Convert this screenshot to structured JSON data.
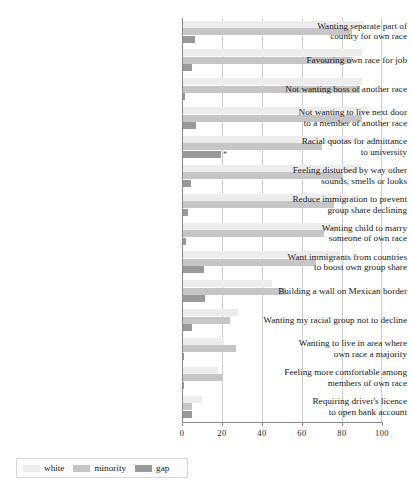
{
  "chart_data": {
    "type": "bar",
    "orientation": "horizontal",
    "title": "",
    "subtitle": "",
    "xlabel": "",
    "ylabel": "",
    "xlim": [
      0,
      100
    ],
    "xticks": [
      0,
      20,
      40,
      60,
      80,
      100
    ],
    "xtick_labels": [
      "0",
      "20",
      "40",
      "60",
      "80",
      "100"
    ],
    "grid": true,
    "grid_axis": "x",
    "legend_position": "bottom-left",
    "legend": [
      {
        "name": "white",
        "color": "#ececec"
      },
      {
        "name": "minority",
        "color": "#c6c6c6"
      },
      {
        "name": "gap",
        "color": "#9a9a9a"
      }
    ],
    "categories": [
      "Wanting separate part of\ncountry for own race",
      "Favouring own race for job",
      "Not wanting boss of another race",
      "Not wanting to live next door\nto a member of another race",
      "Racial quotas for admittance\nto university",
      "Feeling disturbed by way other\nsounds, smells or looks",
      "Reduce immigration to prevent\ngroup share declining",
      "Wanting child to marry\nsomeone of own race",
      "Want immigrants from countries\nto boost own group share",
      "Building a wall on Mexican border",
      "Wanting my racial group not to decline",
      "Wanting to live in area where\nown race a majority",
      "Feeling more comfortable among\nmembers of own race",
      "Requiring driver's licence\nto open bank account"
    ],
    "series": [
      {
        "name": "white",
        "color": "#ececec",
        "values": [
          91,
          90,
          90,
          93,
          86,
          89,
          83,
          78,
          79,
          45,
          28,
          21,
          18,
          10
        ]
      },
      {
        "name": "minority",
        "color": "#c6c6c6",
        "values": [
          85,
          85,
          89,
          90,
          70,
          80,
          76,
          71,
          67,
          52,
          24,
          27,
          20,
          5
        ]
      },
      {
        "name": "gap",
        "color": "#9a9a9a",
        "values": [
          6.5,
          5,
          1.5,
          7,
          19.5,
          4.5,
          3,
          2,
          11,
          11.5,
          5,
          1,
          1,
          5
        ]
      }
    ],
    "annotations": [
      {
        "category_index": 4,
        "series": "gap",
        "marker": "*",
        "value": 21.5
      }
    ]
  },
  "axis": {
    "tick_labels": [
      "0",
      "20",
      "40",
      "60",
      "80",
      "100"
    ]
  },
  "legend": {
    "items": [
      {
        "label": "white"
      },
      {
        "label": "minority"
      },
      {
        "label": "gap"
      }
    ]
  }
}
